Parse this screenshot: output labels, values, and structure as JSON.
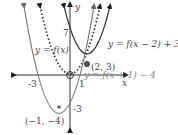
{
  "diagram": {
    "axes": {
      "x_label": "x",
      "y_label": "y",
      "x_ticks": [
        "-3",
        "1"
      ],
      "y_ticks": [
        "7",
        "-3"
      ]
    },
    "curves": [
      {
        "id": "f",
        "label": "y = f(x)",
        "style": "dotted",
        "color": "#222222",
        "vertex": "(0, 0)"
      },
      {
        "id": "shift-right-up",
        "label": "y = f(x − 2) + 3",
        "style": "solid",
        "color": "#333333",
        "vertex": "(2, 3)"
      },
      {
        "id": "shift-left-down",
        "label": "y = f(x + 1) − 4",
        "style": "solid",
        "color": "#777777",
        "vertex": "(−1, −4)"
      }
    ],
    "points": {
      "p1": "(2, 3)",
      "p2": "(−1, −4)"
    }
  }
}
